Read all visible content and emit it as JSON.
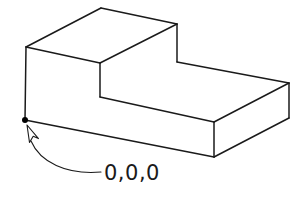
{
  "figure": {
    "background_color": "#ffffff",
    "line_color": "#1a1a1a",
    "face_color": "#ffffff"
  },
  "annotation": {
    "origin_label": "0,0,0",
    "origin_marker": "origin-point-dot",
    "cursor": "mouse-pointer-icon",
    "leader": "curved-leader-line"
  },
  "geometry": {
    "type": "isometric-solid",
    "name": "l-shaped-step-block",
    "vertices": {
      "top_face_left": [
        26,
        47
      ],
      "top_face_back": [
        101,
        8
      ],
      "top_face_right": [
        177,
        24
      ],
      "top_face_front": [
        100,
        63
      ],
      "upper_right_bottom": [
        177,
        62
      ],
      "step_inner_bottom": [
        100,
        97
      ],
      "lower_top_right_far": [
        289,
        83
      ],
      "lower_right_bottom_far": [
        289,
        118
      ],
      "lower_front_top": [
        214,
        122
      ],
      "lower_front_bottom": [
        214,
        157
      ],
      "origin": [
        25,
        120
      ]
    },
    "origin_point": [
      25,
      120
    ],
    "label_position": [
      104,
      180
    ]
  }
}
